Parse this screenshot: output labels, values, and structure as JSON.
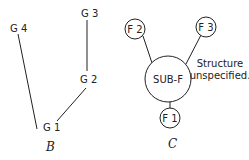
{
  "diagram_b": {
    "caption": "B",
    "nodes": [
      {
        "id": "G1",
        "label": "G 1"
      },
      {
        "id": "G2",
        "label": "G 2"
      },
      {
        "id": "G3",
        "label": "G 3"
      },
      {
        "id": "G4",
        "label": "G 4"
      }
    ]
  },
  "diagram_c": {
    "caption": "C",
    "center": "SUB-F",
    "nodes": [
      {
        "id": "F1",
        "label": "F 1"
      },
      {
        "id": "F2",
        "label": "F 2"
      },
      {
        "id": "F3",
        "label": "F 3"
      }
    ],
    "note_line1": "Structure",
    "note_line2": "unspecified."
  }
}
